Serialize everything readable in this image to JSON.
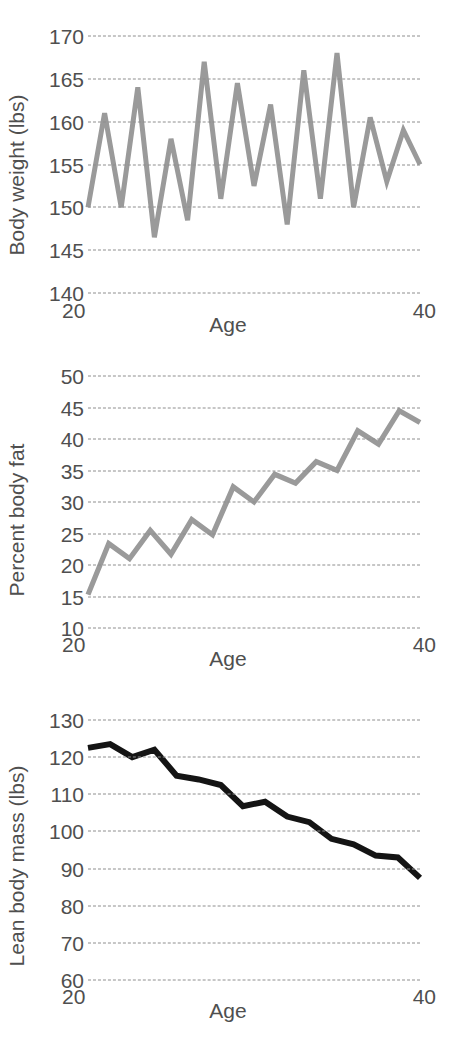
{
  "figure": {
    "background_color": "#ffffff",
    "text_color": "#4f4f4f",
    "gridline_color": "#8e8e8e"
  },
  "panels": [
    {
      "id": "body-weight",
      "ylabel": "Body weight (lbs)",
      "xlabel": "Age",
      "x_tick_left": "20",
      "x_tick_right": "40",
      "y_ticks": [
        "170",
        "165",
        "160",
        "155",
        "150",
        "145",
        "140"
      ],
      "line_color": "#9a9a9a"
    },
    {
      "id": "percent-body-fat",
      "ylabel": "Percent body fat",
      "xlabel": "Age",
      "x_tick_left": "20",
      "x_tick_right": "40",
      "y_ticks": [
        "50",
        "45",
        "40",
        "35",
        "30",
        "25",
        "20",
        "15",
        "10"
      ],
      "line_color": "#9a9a9a"
    },
    {
      "id": "lean-body-mass",
      "ylabel": "Lean body mass (lbs)",
      "xlabel": "Age",
      "x_tick_left": "20",
      "x_tick_right": "40",
      "y_ticks": [
        "130",
        "120",
        "110",
        "100",
        "90",
        "80",
        "70",
        "60"
      ],
      "line_color": "#141414"
    }
  ],
  "chart_data": [
    {
      "type": "line",
      "title": "",
      "xlabel": "Age",
      "ylabel": "Body weight (lbs)",
      "xlim": [
        20,
        40
      ],
      "ylim": [
        140,
        170
      ],
      "yticks": [
        140,
        145,
        150,
        155,
        160,
        165,
        170
      ],
      "xticks": [
        20,
        40
      ],
      "grid": true,
      "legend": "none",
      "line_color": "#9a9a9a",
      "x": [
        20.5,
        21.5,
        22.5,
        23.5,
        24.5,
        25.5,
        26.5,
        27.5,
        28.5,
        29.5,
        30.5,
        31.5,
        32.5,
        33.5,
        34.5,
        35.5,
        36.5,
        37.5,
        38.5,
        39.5,
        40.0
      ],
      "values": [
        150.0,
        161.0,
        150.0,
        164.0,
        146.5,
        158.0,
        148.5,
        167.0,
        151.0,
        164.5,
        152.5,
        162.0,
        148.0,
        166.0,
        151.0,
        168.0,
        150.0,
        160.5,
        153.0,
        159.0,
        155.0
      ]
    },
    {
      "type": "line",
      "title": "",
      "xlabel": "Age",
      "ylabel": "Percent body fat",
      "xlim": [
        20,
        40
      ],
      "ylim": [
        10,
        50
      ],
      "yticks": [
        10,
        15,
        20,
        25,
        30,
        35,
        40,
        45,
        50
      ],
      "xticks": [
        20,
        40
      ],
      "grid": true,
      "legend": "none",
      "line_color": "#9a9a9a",
      "x": [
        20.5,
        21.5,
        22.5,
        23.5,
        24.5,
        25.5,
        26.5,
        27.5,
        28.5,
        29.5,
        30.5,
        31.5,
        32.5,
        33.5,
        34.5,
        35.5,
        36.5,
        37.5,
        38.5,
        39.5
      ],
      "values": [
        15.3,
        23.4,
        21.0,
        25.5,
        21.7,
        27.2,
        24.8,
        32.4,
        30.0,
        34.4,
        33.0,
        36.4,
        35.0,
        41.3,
        39.2,
        44.5,
        42.6
      ]
    },
    {
      "type": "line",
      "title": "",
      "xlabel": "Age",
      "ylabel": "Lean body mass (lbs)",
      "xlim": [
        20,
        40
      ],
      "ylim": [
        60,
        130
      ],
      "yticks": [
        60,
        70,
        80,
        90,
        100,
        110,
        120,
        130
      ],
      "xticks": [
        20,
        40
      ],
      "grid": true,
      "legend": "none",
      "line_color": "#141414",
      "x": [
        20.5,
        21.5,
        22.5,
        23.5,
        24.5,
        25.5,
        26.5,
        27.5,
        28.5,
        29.5,
        30.5,
        31.5,
        32.5,
        33.5,
        34.5,
        35.5,
        36.5,
        37.5,
        38.5,
        39.5
      ],
      "values": [
        122.5,
        123.5,
        120.0,
        122.0,
        115.0,
        114.0,
        112.5,
        106.8,
        108.0,
        104.0,
        102.5,
        98.0,
        96.5,
        93.5,
        93.0,
        87.5
      ]
    }
  ]
}
